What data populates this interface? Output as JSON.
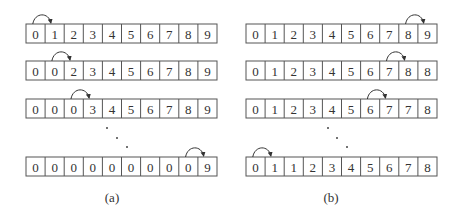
{
  "diagram": {
    "cell_width": 19.1,
    "cell_height": 19,
    "stroke_color": "#555555",
    "text_color": "#333333",
    "panels": [
      {
        "id": "a",
        "caption": "(a)",
        "x": 26,
        "caption_pos": [
          112,
          202
        ],
        "dots": [
          [
            107,
            128
          ],
          [
            117,
            138
          ],
          [
            127,
            147
          ]
        ],
        "rows": [
          {
            "y": 24,
            "values": [
              "0",
              "1",
              "2",
              "3",
              "4",
              "5",
              "6",
              "7",
              "8",
              "9"
            ],
            "arrow": {
              "from": 0,
              "to": 1
            }
          },
          {
            "y": 61,
            "values": [
              "0",
              "0",
              "2",
              "3",
              "4",
              "5",
              "6",
              "7",
              "8",
              "9"
            ],
            "arrow": {
              "from": 1,
              "to": 2
            }
          },
          {
            "y": 99,
            "values": [
              "0",
              "0",
              "0",
              "3",
              "4",
              "5",
              "6",
              "7",
              "8",
              "9"
            ],
            "arrow": {
              "from": 2,
              "to": 3
            }
          },
          {
            "y": 157,
            "values": [
              "0",
              "0",
              "0",
              "0",
              "0",
              "0",
              "0",
              "0",
              "0",
              "9"
            ],
            "arrow": {
              "from": 8,
              "to": 9
            }
          }
        ]
      },
      {
        "id": "b",
        "caption": "(b)",
        "x": 246,
        "caption_pos": [
          331,
          202
        ],
        "dots": [
          [
            328,
            128
          ],
          [
            337,
            138
          ],
          [
            347,
            147
          ]
        ],
        "rows": [
          {
            "y": 24,
            "values": [
              "0",
              "1",
              "2",
              "3",
              "4",
              "5",
              "6",
              "7",
              "8",
              "9"
            ],
            "arrow": {
              "from": 8,
              "to": 9
            }
          },
          {
            "y": 61,
            "values": [
              "0",
              "1",
              "2",
              "3",
              "4",
              "5",
              "6",
              "7",
              "8",
              "8"
            ],
            "arrow": {
              "from": 7,
              "to": 8
            }
          },
          {
            "y": 99,
            "values": [
              "0",
              "1",
              "2",
              "3",
              "4",
              "5",
              "6",
              "7",
              "7",
              "8"
            ],
            "arrow": {
              "from": 6,
              "to": 7
            }
          },
          {
            "y": 157,
            "values": [
              "0",
              "1",
              "1",
              "2",
              "3",
              "4",
              "5",
              "6",
              "7",
              "8"
            ],
            "arrow": {
              "from": 0,
              "to": 1
            }
          }
        ]
      }
    ]
  }
}
